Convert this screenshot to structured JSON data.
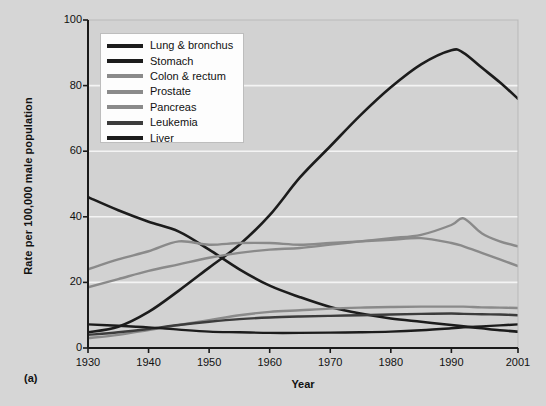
{
  "figure": {
    "panel_label": "(a)",
    "xlabel": "Year",
    "ylabel": "Rate per 100,000 male population"
  },
  "colors": {
    "background": "#d6d6d6",
    "plot_background": "#d2d2d2",
    "gridline": "#f4f4f4",
    "axis": "#1a1a1a",
    "dark": "#1c1c1c",
    "mid_gray": "#8a8a8a",
    "dark_gray": "#5a5a5a"
  },
  "legend": {
    "position": "top-left-inside",
    "entries": [
      {
        "label": "Lung & bronchus",
        "color": "#1c1c1c"
      },
      {
        "label": "Stomach",
        "color": "#1c1c1c"
      },
      {
        "label": "Colon & rectum",
        "color": "#8a8a8a"
      },
      {
        "label": "Prostate",
        "color": "#8a8a8a"
      },
      {
        "label": "Pancreas",
        "color": "#8a8a8a"
      },
      {
        "label": "Leukemia",
        "color": "#3c3c3c"
      },
      {
        "label": "Liver",
        "color": "#1c1c1c"
      }
    ]
  },
  "chart_data": {
    "type": "line",
    "title": "",
    "subtitle": "",
    "xlabel": "Year",
    "ylabel": "Rate per 100,000 male population",
    "xlim": [
      1930,
      2001
    ],
    "ylim": [
      0,
      100
    ],
    "grid": true,
    "gridlines_y": [
      20,
      40,
      60,
      80
    ],
    "legend_position": "top-left-inside",
    "xticks": [
      1930,
      1940,
      1950,
      1960,
      1970,
      1980,
      1990,
      2001
    ],
    "xtick_labels": [
      "1930",
      "1940",
      "1950",
      "1960",
      "1970",
      "1980",
      "1990",
      "2001"
    ],
    "yticks": [
      0,
      20,
      40,
      60,
      80,
      100
    ],
    "ytick_labels": [
      "0",
      "20",
      "40",
      "60",
      "80",
      "100"
    ],
    "x": [
      1930,
      1935,
      1940,
      1945,
      1950,
      1955,
      1960,
      1965,
      1970,
      1975,
      1980,
      1985,
      1990,
      1992,
      1995,
      1998,
      2001
    ],
    "series": [
      {
        "name": "Lung & bronchus",
        "color": "#1c1c1c",
        "width": 2.6,
        "values": [
          4.8,
          6.5,
          11.0,
          17.5,
          24.5,
          31.5,
          40.5,
          52.0,
          61.5,
          71.0,
          79.5,
          86.5,
          90.8,
          90.0,
          85.5,
          81.0,
          76.0
        ]
      },
      {
        "name": "Stomach",
        "color": "#1c1c1c",
        "width": 2.6,
        "values": [
          46.0,
          42.0,
          38.5,
          35.5,
          30.0,
          24.0,
          19.0,
          15.5,
          12.5,
          10.5,
          9.0,
          8.0,
          7.0,
          6.6,
          6.0,
          5.4,
          5.0
        ]
      },
      {
        "name": "Colon & rectum",
        "color": "#8a8a8a",
        "width": 2.4,
        "values": [
          24.0,
          27.0,
          29.5,
          32.5,
          31.5,
          32.0,
          32.0,
          31.5,
          32.0,
          32.5,
          33.0,
          33.5,
          32.0,
          31.0,
          29.0,
          27.0,
          25.0
        ]
      },
      {
        "name": "Prostate",
        "color": "#8a8a8a",
        "width": 2.4,
        "values": [
          18.5,
          21.0,
          23.5,
          25.5,
          27.5,
          29.0,
          30.0,
          30.5,
          31.5,
          32.5,
          33.5,
          34.5,
          37.5,
          39.5,
          35.0,
          32.5,
          31.0
        ]
      },
      {
        "name": "Pancreas",
        "color": "#8a8a8a",
        "width": 2.4,
        "values": [
          3.0,
          4.0,
          5.5,
          7.0,
          8.5,
          10.0,
          11.0,
          11.5,
          12.0,
          12.3,
          12.5,
          12.6,
          12.6,
          12.6,
          12.4,
          12.3,
          12.2
        ]
      },
      {
        "name": "Leukemia",
        "color": "#3c3c3c",
        "width": 2.4,
        "values": [
          4.0,
          4.8,
          5.8,
          7.0,
          8.0,
          8.8,
          9.3,
          9.6,
          9.8,
          10.0,
          10.2,
          10.4,
          10.5,
          10.4,
          10.3,
          10.2,
          10.0
        ]
      },
      {
        "name": "Liver",
        "color": "#1c1c1c",
        "width": 2.4,
        "values": [
          7.2,
          6.8,
          6.3,
          5.6,
          5.0,
          4.8,
          4.6,
          4.6,
          4.7,
          4.8,
          5.0,
          5.4,
          6.0,
          6.3,
          6.6,
          6.9,
          7.2
        ]
      }
    ]
  }
}
